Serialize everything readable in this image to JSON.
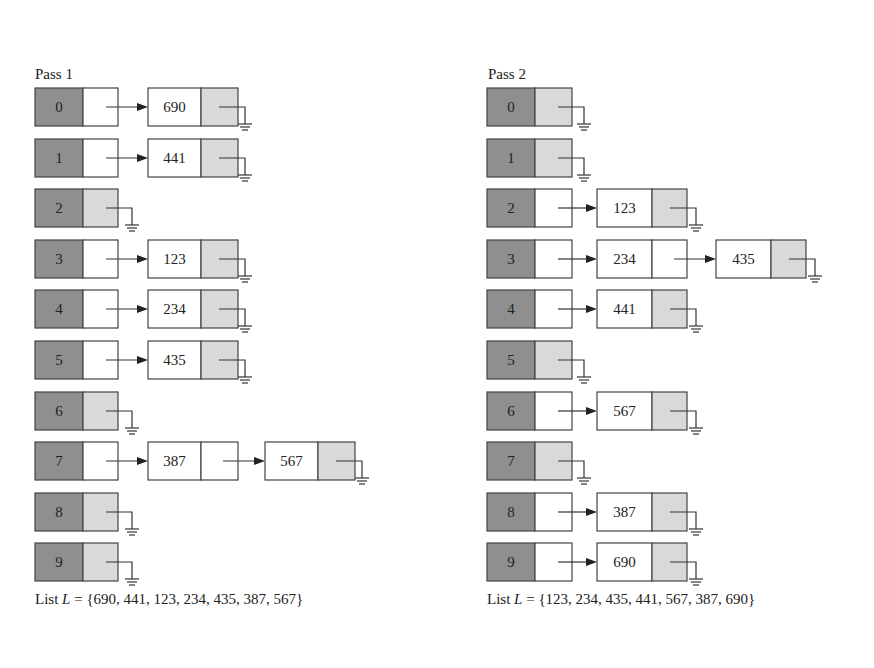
{
  "passes": [
    {
      "label": "Pass 1",
      "list_prefix": "List ",
      "list_var": "L",
      "list_values": "= {690, 441, 123, 234, 435, 387, 567}",
      "buckets": [
        {
          "index": "0",
          "nodes": [
            "690"
          ]
        },
        {
          "index": "1",
          "nodes": [
            "441"
          ]
        },
        {
          "index": "2",
          "nodes": []
        },
        {
          "index": "3",
          "nodes": [
            "123"
          ]
        },
        {
          "index": "4",
          "nodes": [
            "234"
          ]
        },
        {
          "index": "5",
          "nodes": [
            "435"
          ]
        },
        {
          "index": "6",
          "nodes": []
        },
        {
          "index": "7",
          "nodes": [
            "387",
            "567"
          ]
        },
        {
          "index": "8",
          "nodes": []
        },
        {
          "index": "9",
          "nodes": []
        }
      ]
    },
    {
      "label": "Pass 2",
      "list_prefix": "List ",
      "list_var": "L",
      "list_values": "= {123, 234, 435, 441, 567, 387, 690}",
      "buckets": [
        {
          "index": "0",
          "nodes": []
        },
        {
          "index": "1",
          "nodes": []
        },
        {
          "index": "2",
          "nodes": [
            "123"
          ]
        },
        {
          "index": "3",
          "nodes": [
            "234",
            "435"
          ]
        },
        {
          "index": "4",
          "nodes": [
            "441"
          ]
        },
        {
          "index": "5",
          "nodes": []
        },
        {
          "index": "6",
          "nodes": [
            "567"
          ]
        },
        {
          "index": "7",
          "nodes": []
        },
        {
          "index": "8",
          "nodes": [
            "387"
          ]
        },
        {
          "index": "9",
          "nodes": [
            "690"
          ]
        }
      ]
    }
  ],
  "colors": {
    "index_cell": "#8f8f8f",
    "null_pointer_cell": "#d9d9d9",
    "border": "#444444"
  }
}
